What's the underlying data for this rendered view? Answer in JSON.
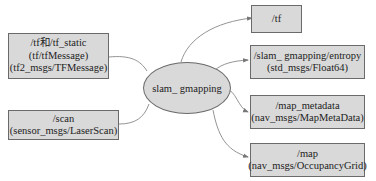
{
  "diagram": {
    "type": "ros-node-graph",
    "center_node": {
      "label": "slam_ gmapping"
    },
    "inputs": [
      {
        "lines": [
          "/tf和/tf_static",
          "(tf/tfMessage)",
          "(tf2_msgs/TFMessage)"
        ]
      },
      {
        "lines": [
          "/scan",
          "(sensor_msgs/LaserScan)"
        ]
      }
    ],
    "outputs": [
      {
        "lines": [
          "/tf"
        ]
      },
      {
        "lines": [
          "/slam_ gmapping/entropy",
          "(std_msgs/Float64)"
        ]
      },
      {
        "lines": [
          "/map_metadata",
          "(nav_msgs/MapMetaData)"
        ]
      },
      {
        "lines": [
          "/map",
          "(nav_msgs/OccupancyGrid)"
        ]
      }
    ],
    "colors": {
      "node_fill": "#d9d9d9",
      "node_border": "#6a6a6a",
      "edge": "#777777",
      "background": "#ffffff"
    }
  }
}
